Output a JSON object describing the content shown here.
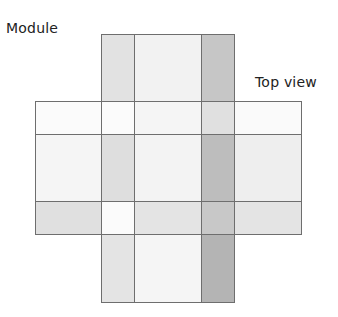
{
  "labels": {
    "module": "Module",
    "view": "Top view"
  },
  "grid": {
    "columns_x": [
      35,
      101,
      134,
      201,
      234,
      301
    ],
    "rows_y": [
      34,
      101,
      134,
      201,
      234,
      302
    ],
    "border_color": "#6e6e6e",
    "cells": [
      {
        "row": 0,
        "col": 1,
        "color": "#e2e2e2"
      },
      {
        "row": 0,
        "col": 2,
        "color": "#f2f2f2"
      },
      {
        "row": 0,
        "col": 3,
        "color": "#c6c6c6"
      },
      {
        "row": 1,
        "col": 0,
        "color": "#fbfbfb"
      },
      {
        "row": 1,
        "col": 1,
        "color": "#fbfbfb"
      },
      {
        "row": 1,
        "col": 2,
        "color": "#f5f5f5"
      },
      {
        "row": 1,
        "col": 3,
        "color": "#e0e0e0"
      },
      {
        "row": 1,
        "col": 4,
        "color": "#fafafa"
      },
      {
        "row": 2,
        "col": 0,
        "color": "#f5f5f5"
      },
      {
        "row": 2,
        "col": 1,
        "color": "#dedede"
      },
      {
        "row": 2,
        "col": 2,
        "color": "#f3f3f3"
      },
      {
        "row": 2,
        "col": 3,
        "color": "#bdbdbd"
      },
      {
        "row": 2,
        "col": 4,
        "color": "#eeeeee"
      },
      {
        "row": 3,
        "col": 0,
        "color": "#e0e0e0"
      },
      {
        "row": 3,
        "col": 1,
        "color": "#fbfbfb"
      },
      {
        "row": 3,
        "col": 2,
        "color": "#e4e4e4"
      },
      {
        "row": 3,
        "col": 3,
        "color": "#c8c8c8"
      },
      {
        "row": 3,
        "col": 4,
        "color": "#e4e4e4"
      },
      {
        "row": 4,
        "col": 1,
        "color": "#e4e4e4"
      },
      {
        "row": 4,
        "col": 2,
        "color": "#f5f5f5"
      },
      {
        "row": 4,
        "col": 3,
        "color": "#b4b4b4"
      }
    ]
  }
}
